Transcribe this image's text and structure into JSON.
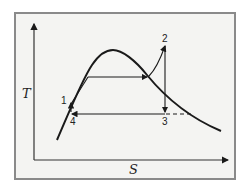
{
  "diagram": {
    "type": "T-s diagram (vapor cycle with superheat)",
    "axes": {
      "y_label": "T",
      "x_label": "S"
    },
    "points": [
      {
        "id": "1",
        "label": "1"
      },
      {
        "id": "2",
        "label": "2"
      },
      {
        "id": "3",
        "label": "3"
      },
      {
        "id": "4",
        "label": "4"
      }
    ],
    "colors": {
      "line": "#1a1a1a",
      "frame": "#8a8a8a",
      "background": "#f4f4f2"
    }
  }
}
